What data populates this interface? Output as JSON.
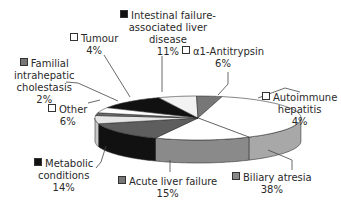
{
  "chart_data": {
    "type": "pie",
    "style": "3d-exploded-none",
    "title": "",
    "slices": [
      {
        "label": "Intestinal failure-associated liver disease",
        "value": 11,
        "pct_label": "11%",
        "color": "#111111",
        "side": "#000000"
      },
      {
        "label": "α1-Antitrypsin",
        "value": 6,
        "pct_label": "6%",
        "color": "#f2f2f2",
        "side": "#d8d8d8"
      },
      {
        "label": "Autoimmune hepatitis",
        "value": 4,
        "pct_label": "4%",
        "color": "#777777",
        "side": "#5a5a5a"
      },
      {
        "label": "Biliary atresia",
        "value": 38,
        "pct_label": "38%",
        "color": "#ffffff",
        "side": "#a8a8a8"
      },
      {
        "label": "Acute liver failure",
        "value": 15,
        "pct_label": "15%",
        "color": "#ffffff",
        "side": "#8a8a8a"
      },
      {
        "label": "Metabolic conditions",
        "value": 14,
        "pct_label": "14%",
        "color": "#5e5e5e",
        "side": "#111111"
      },
      {
        "label": "Other",
        "value": 6,
        "pct_label": "6%",
        "color": "#e6e6e6",
        "side": "#c8c8c8"
      },
      {
        "label": "Familial intrahepatic cholestasis",
        "value": 2,
        "pct_label": "2%",
        "color": "#6a6a6a",
        "side": "#4a4a4a"
      },
      {
        "label": "Tumour",
        "value": 4,
        "pct_label": "4%",
        "color": "#ffffff",
        "side": "#dddddd"
      }
    ],
    "legend_position": "callouts"
  },
  "labels": {
    "intestinal": {
      "marker": "black",
      "lines": [
        "Intestinal failure-",
        "associated liver",
        "disease",
        "11%"
      ]
    },
    "alpha1": {
      "marker": "white",
      "lines": [
        "α1-Antitrypsin",
        "6%"
      ]
    },
    "autoimmune": {
      "marker": "white",
      "lines": [
        "Autoimmune",
        "hepatitis",
        "4%"
      ]
    },
    "biliary": {
      "marker": "grey",
      "lines": [
        "Biliary atresia",
        "38%"
      ]
    },
    "acute": {
      "marker": "grey",
      "lines": [
        "Acute liver failure",
        "15%"
      ]
    },
    "metabolic": {
      "marker": "black",
      "lines": [
        "Metabolic",
        "conditions",
        "14%"
      ]
    },
    "other": {
      "marker": "white",
      "lines": [
        "Other",
        "6%"
      ]
    },
    "familial": {
      "marker": "grey",
      "lines": [
        "Familial",
        "intrahepatic",
        "cholestasis",
        "2%"
      ]
    },
    "tumour": {
      "marker": "white",
      "lines": [
        "Tumour",
        "4%"
      ]
    }
  }
}
